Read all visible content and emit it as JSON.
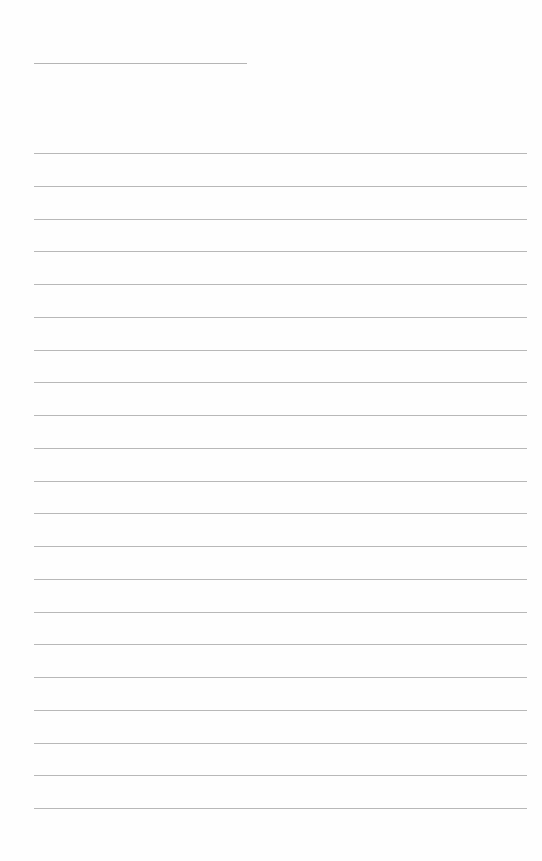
{
  "document": {
    "type": "lined-paper",
    "header_line": {
      "x": 34,
      "y": 63,
      "width": 213
    },
    "ruled_lines": {
      "count": 21,
      "start_y": 153,
      "spacing": 32.75,
      "x": 34,
      "width": 493
    },
    "colors": {
      "paper": "#fefefe",
      "line": "#b8b8b8"
    }
  }
}
